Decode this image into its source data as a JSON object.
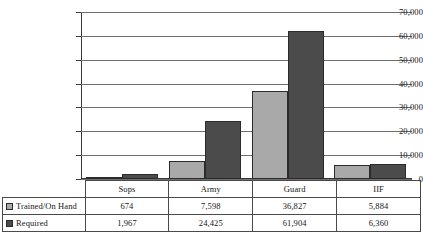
{
  "chart_data": {
    "type": "bar",
    "title": "",
    "subtitle": "",
    "xlabel": "",
    "ylabel": "",
    "categories": [
      "Sops",
      "Army",
      "Guard",
      "IIF"
    ],
    "series": [
      {
        "name": "Trained/On Hand",
        "color": "#a9a9a9",
        "values": [
          674,
          7598,
          36827,
          5884
        ],
        "labels": [
          "674",
          "7,598",
          "36,827",
          "5,884"
        ]
      },
      {
        "name": "Required",
        "color": "#4b4b4b",
        "values": [
          1967,
          24425,
          61904,
          6360
        ],
        "labels": [
          "1,967",
          "24,425",
          "61,904",
          "6,360"
        ]
      }
    ],
    "ylim": [
      0,
      70000
    ],
    "y_tick_values": [
      0,
      10000,
      20000,
      30000,
      40000,
      50000,
      60000,
      70000
    ],
    "y_tick_labels": [
      "0",
      "10,000",
      "20,000",
      "30,000",
      "40,000",
      "50,000",
      "60,000",
      "70,000"
    ],
    "grid": true,
    "legend_position": "table-left-column",
    "data_table_visible": true
  },
  "table": {
    "corner_label": "",
    "column_headers": [
      "Sops",
      "Army",
      "Guard",
      "IIF"
    ],
    "rows": [
      {
        "label": "Trained/On Hand",
        "swatch_color": "#a9a9a9",
        "cells": [
          "674",
          "7,598",
          "36,827",
          "5,884"
        ]
      },
      {
        "label": "Required",
        "swatch_color": "#4b4b4b",
        "cells": [
          "1,967",
          "24,425",
          "61,904",
          "6,360"
        ]
      }
    ]
  }
}
